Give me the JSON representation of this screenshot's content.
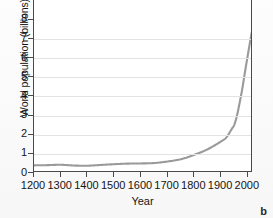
{
  "panel": {
    "label": "b"
  },
  "chart_data": {
    "type": "line",
    "title": "",
    "xlabel": "Year",
    "ylabel": "World population (billions)",
    "xlim": [
      1200,
      2015
    ],
    "ylim": [
      0,
      8
    ],
    "grid": true,
    "legend": "none",
    "line_color": "#9a9a9a",
    "xticks": [
      1200,
      1300,
      1400,
      1500,
      1600,
      1700,
      1800,
      1900,
      2000
    ],
    "xticklabels": [
      "1200",
      "1300",
      "1400",
      "1500",
      "1600",
      "1700",
      "1800",
      "1900",
      "2000"
    ],
    "yticks": [
      0,
      1,
      2,
      3,
      4,
      5,
      6,
      7,
      8
    ],
    "yticklabels": [
      "0",
      "1",
      "2",
      "3",
      "4",
      "5",
      "6",
      "7",
      "8"
    ],
    "series": [
      {
        "name": "World population",
        "x": [
          1200,
          1250,
          1300,
          1350,
          1400,
          1450,
          1500,
          1550,
          1600,
          1650,
          1700,
          1750,
          1800,
          1850,
          1900,
          1920,
          1940,
          1950,
          1960,
          1970,
          1980,
          1990,
          2000,
          2010,
          2015
        ],
        "values": [
          0.4,
          0.41,
          0.43,
          0.39,
          0.38,
          0.42,
          0.46,
          0.49,
          0.5,
          0.52,
          0.6,
          0.72,
          0.95,
          1.24,
          1.65,
          1.86,
          2.3,
          2.54,
          3.03,
          3.7,
          4.45,
          5.32,
          6.15,
          6.96,
          7.35
        ]
      }
    ]
  }
}
